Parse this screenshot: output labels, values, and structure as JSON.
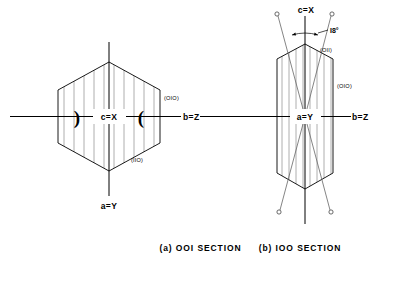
{
  "figure": {
    "kind": "crystal-optical-orientation-diagram",
    "background": "#ffffff",
    "ink": "#000000",
    "hatch_color": "#9a9a9a"
  },
  "panel_a": {
    "caption": "(a)  OOI  SECTION",
    "center_label": "c=X",
    "bottom_axis_label": "a=Y",
    "right_axis_label": "b=Z",
    "face_label_right": "(OIO)",
    "face_label_lower": "(IIO)",
    "optic_bracket_left": ")",
    "optic_bracket_right": "(",
    "outline": "hexagon",
    "hatch_count": 11
  },
  "panel_b": {
    "caption": "(b)  IOO  SECTION",
    "center_label": "a=Y",
    "top_axis_label": "c=X",
    "right_axis_label": "b=Z",
    "left_axis_label": "b=Z",
    "face_label_upper": "(OII)",
    "face_label_right": "(OIO)",
    "angle_label": "I8°",
    "outline": "elongated-prism",
    "hatch_count": 8,
    "optic_axis_marker_count": 4
  }
}
